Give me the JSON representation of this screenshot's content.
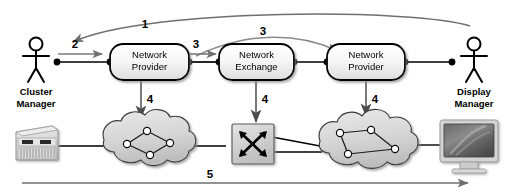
{
  "diagram": {
    "background": "#ffffff",
    "colors": {
      "stroke": "#000000",
      "gray_arrow": "#777777",
      "cloud_fill": "#d8d8d8",
      "cloud_stroke": "#333333",
      "box_fill": "#f2f2f2",
      "box_stroke": "#000000",
      "switch_fill": "#cfcfcf",
      "monitor_screen": "#5a5a5a",
      "server_fill": "#dcdcdc"
    },
    "actors": [
      {
        "id": "cluster-manager",
        "name": "stick-figure-actor",
        "label_line1": "Cluster",
        "label_line2": "Manager",
        "x": 36,
        "y": 48
      },
      {
        "id": "display-manager",
        "name": "stick-figure-actor",
        "label_line1": "Display",
        "label_line2": "Manager",
        "x": 474,
        "y": 48
      }
    ],
    "nodes": [
      {
        "id": "network-provider-left",
        "line1": "Network",
        "line2": "Provider",
        "cx": 149,
        "cy": 62
      },
      {
        "id": "network-exchange",
        "line1": "Network",
        "line2": "Exchange",
        "cx": 256,
        "cy": 62
      },
      {
        "id": "network-provider-right",
        "line1": "Network",
        "line2": "Provider",
        "cx": 366,
        "cy": 62
      }
    ],
    "devices": [
      {
        "id": "cluster-server",
        "name": "server-icon",
        "label": ""
      },
      {
        "id": "network-cloud-left",
        "name": "cloud-icon",
        "label": ""
      },
      {
        "id": "exchange-switch",
        "name": "switch-icon",
        "label": ""
      },
      {
        "id": "network-cloud-right",
        "name": "cloud-icon",
        "label": ""
      },
      {
        "id": "display-monitor",
        "name": "monitor-icon",
        "label": ""
      }
    ],
    "steps": [
      {
        "id": "step-1",
        "label": "1",
        "x": 145,
        "y": 28,
        "description": "Display Manager to Cluster Manager (long top curve)"
      },
      {
        "id": "step-2",
        "label": "2",
        "x": 75,
        "y": 46,
        "description": "Cluster Manager to Network Provider (left)"
      },
      {
        "id": "step-3a",
        "label": "3",
        "x": 196,
        "y": 46,
        "description": "Network Provider (left) to Network Exchange"
      },
      {
        "id": "step-3b",
        "label": "3",
        "x": 263,
        "y": 32,
        "description": "Network Exchange to Network Provider (right)"
      },
      {
        "id": "step-4a",
        "label": "4",
        "x": 146,
        "y": 101,
        "description": "Network Provider (left) configures left cloud"
      },
      {
        "id": "step-4b",
        "label": "4",
        "x": 262,
        "y": 101,
        "description": "Network Exchange configures switch"
      },
      {
        "id": "step-4c",
        "label": "4",
        "x": 371,
        "y": 101,
        "description": "Network Provider (right) configures right cloud"
      },
      {
        "id": "step-5",
        "label": "5",
        "x": 210,
        "y": 176,
        "description": "End-to-end data path from cluster server to display"
      }
    ]
  }
}
